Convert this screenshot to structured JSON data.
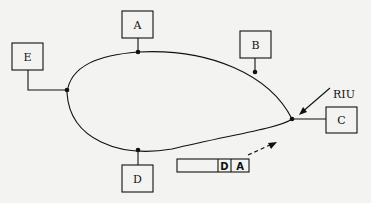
{
  "diagram": {
    "type": "ring-network",
    "nodes": [
      {
        "id": "A",
        "label": "A"
      },
      {
        "id": "B",
        "label": "B"
      },
      {
        "id": "C",
        "label": "C"
      },
      {
        "id": "D",
        "label": "D"
      },
      {
        "id": "E",
        "label": "E"
      }
    ],
    "annotation": {
      "label": "RIU"
    },
    "packet": {
      "fields": [
        "",
        "D",
        "A"
      ]
    }
  }
}
